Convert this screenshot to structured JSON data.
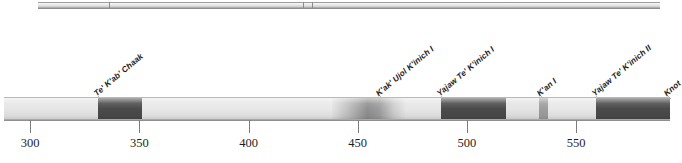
{
  "chart_data": {
    "type": "bar",
    "title": "",
    "subtitle": "",
    "xlabel": "",
    "ylabel": "",
    "orientation": "horizontal-timeline",
    "xlim": [
      288,
      593
    ],
    "grid": false,
    "legend": "none",
    "axis": {
      "ticks": [
        300,
        350,
        400,
        450,
        500,
        550
      ],
      "tick_labels": [
        "300",
        "350",
        "400",
        "450",
        "500",
        "550"
      ],
      "tick_interval": 50
    },
    "categories": [
      "Te' K'ab' Chaak",
      "K'ak' Ujol K'inich I",
      "Yajaw Te' K'inich I",
      "K'an I",
      "Yajaw Te' K'inich II",
      "Knot"
    ],
    "annotations": [
      {
        "label": "Te' K'ab' Chaak",
        "x": 331,
        "truncated": false
      },
      {
        "label": "K'ak' Ujol K'inich I",
        "x": 460,
        "truncated": false
      },
      {
        "label": "Yajaw Te' K'inich I",
        "x": 488,
        "truncated": false
      },
      {
        "label": "K'an I",
        "x": 534,
        "truncated": false
      },
      {
        "label": "Yajaw Te' K'inich II",
        "x": 559,
        "truncated": false
      },
      {
        "label": "Knot",
        "x": 592,
        "truncated": true
      }
    ],
    "segments": [
      {
        "name": "unattested-early",
        "start": 288,
        "end": 331,
        "shade": "light",
        "color": "#e6e6e6"
      },
      {
        "name": "Te' K'ab' Chaak",
        "start": 331,
        "end": 351,
        "shade": "dark",
        "color": "#4a4a4a"
      },
      {
        "name": "gap-1",
        "start": 351,
        "end": 438,
        "shade": "light",
        "color": "#e8e8e8"
      },
      {
        "name": "K'ak' Ujol K'inich I",
        "start": 438,
        "end": 472,
        "shade": "gradient",
        "color": "#9a9a9a"
      },
      {
        "name": "gap-2",
        "start": 472,
        "end": 488,
        "shade": "light",
        "color": "#e6e6e6"
      },
      {
        "name": "Yajaw Te' K'inich I",
        "start": 488,
        "end": 518,
        "shade": "dark",
        "color": "#4a4a4a"
      },
      {
        "name": "gap-3",
        "start": 518,
        "end": 533,
        "shade": "light",
        "color": "#e4e4e4"
      },
      {
        "name": "K'an I",
        "start": 533,
        "end": 537,
        "shade": "medium",
        "color": "#9e9e9e"
      },
      {
        "name": "gap-4",
        "start": 537,
        "end": 559,
        "shade": "light",
        "color": "#e8e8e8"
      },
      {
        "name": "Yajaw Te' K'inich II",
        "start": 559,
        "end": 593,
        "shade": "dark",
        "color": "#4a4a4a"
      }
    ],
    "upper_row": {
      "present": true,
      "clipped": true,
      "dividers": [
        336,
        425,
        429
      ]
    }
  },
  "colors": {
    "dark": "#4a4a4a",
    "medium": "#9e9e9e",
    "light": "#e8e8e8",
    "axis": "#7c7c7c",
    "text": "#1e1e1e",
    "background": "#ffffff"
  }
}
